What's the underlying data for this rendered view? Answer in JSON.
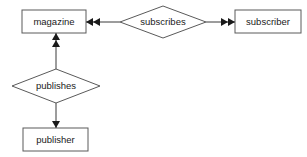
{
  "diagram": {
    "type": "entity-relationship-diagram",
    "background_color": "#ffffff",
    "box_stroke_color": "#5a5a5a",
    "line_color": "#3a3a3a",
    "text_color": "#1a1a1a",
    "entities": [
      {
        "id": "magazine",
        "label": "magazine",
        "shape": "rectangle",
        "x": 22,
        "y": 10,
        "width": 64,
        "height": 23
      },
      {
        "id": "subscriber",
        "label": "subscriber",
        "shape": "rectangle",
        "x": 235,
        "y": 10,
        "width": 66,
        "height": 23
      },
      {
        "id": "publisher",
        "label": "publisher",
        "shape": "rectangle",
        "x": 23,
        "y": 128,
        "width": 65,
        "height": 23
      }
    ],
    "relationships": [
      {
        "id": "subscribes",
        "label": "subscribes",
        "shape": "diamond",
        "cx": 163,
        "cy": 22,
        "rx": 43,
        "ry": 16
      },
      {
        "id": "publishes",
        "label": "publishes",
        "shape": "diamond",
        "cx": 56,
        "cy": 86,
        "rx": 44,
        "ry": 17
      }
    ],
    "connectors": [
      {
        "id": "subscribes-to-magazine",
        "from": "subscribes",
        "to": "magazine",
        "direction": "left",
        "cardinality": "many",
        "arrowheads": 2
      },
      {
        "id": "subscribes-to-subscriber",
        "from": "subscribes",
        "to": "subscriber",
        "direction": "right",
        "cardinality": "many",
        "arrowheads": 2
      },
      {
        "id": "publishes-to-magazine",
        "from": "publishes",
        "to": "magazine",
        "direction": "up",
        "cardinality": "many",
        "arrowheads": 2
      },
      {
        "id": "publishes-to-publisher",
        "from": "publishes",
        "to": "publisher",
        "direction": "down",
        "cardinality": "one",
        "arrowheads": 1
      }
    ]
  }
}
